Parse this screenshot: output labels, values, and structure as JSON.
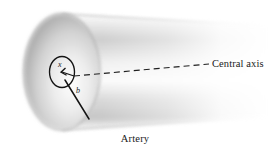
{
  "figure": {
    "name": "artery-cylinder-diagram",
    "caption": "Artery",
    "labels": {
      "central_axis": "Central axis",
      "radial_distance": "x",
      "radius": "b"
    },
    "colors": {
      "background": "#ffffff",
      "ink": "#1a1a1a",
      "body_light": "#f2f2f2",
      "body_mid": "#d8d8d8",
      "body_dark": "#a9a9a9",
      "face_light": "#efefef",
      "face_dark": "#a5a5a5"
    },
    "geometry": {
      "type": "cylinder-perspective",
      "left_face_center": [
        62,
        72
      ],
      "left_face_rx": 38,
      "left_face_ry": 58,
      "axis_start": [
        74,
        76
      ],
      "axis_end": [
        209,
        64
      ],
      "element_ellipse_center": [
        62,
        72
      ],
      "element_ellipse_rx": 12,
      "element_ellipse_ry": 15,
      "radius_line_end": [
        89,
        119
      ]
    }
  }
}
